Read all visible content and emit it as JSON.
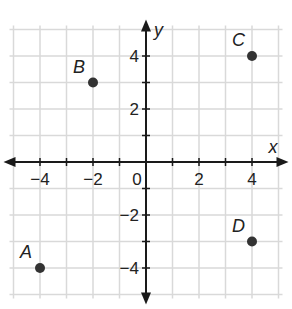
{
  "chart_data": {
    "type": "scatter",
    "title": "",
    "xlabel": "x",
    "ylabel": "y",
    "xlim": [
      -5,
      5
    ],
    "ylim": [
      -5,
      5
    ],
    "grid": true,
    "x_ticks": [
      -4,
      -2,
      0,
      2,
      4
    ],
    "y_ticks": [
      -4,
      -2,
      2,
      4
    ],
    "x_tick_labels": [
      "−4",
      "−2",
      "0",
      "2",
      "4"
    ],
    "y_tick_labels": [
      "−4",
      "−2",
      "2",
      "4"
    ],
    "points": [
      {
        "label": "A",
        "x": -4,
        "y": -4
      },
      {
        "label": "B",
        "x": -2,
        "y": 3
      },
      {
        "label": "C",
        "x": 4,
        "y": 4
      },
      {
        "label": "D",
        "x": 4,
        "y": -3
      }
    ],
    "colors": {
      "grid": "#d9d9d9",
      "axes": "#1a1a1a",
      "point": "#333333"
    }
  },
  "axis": {
    "x_label": "x",
    "y_label": "y",
    "origin_label": "0"
  }
}
